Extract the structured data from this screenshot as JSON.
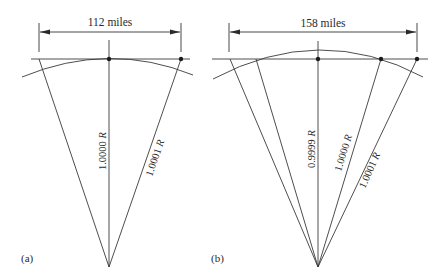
{
  "panels": [
    {
      "id": "a",
      "caption": "(a)",
      "dimension_label": "112 miles",
      "radii": [
        {
          "value": "1.0000",
          "unit": "R"
        },
        {
          "value": "1.0001",
          "unit": "R"
        }
      ]
    },
    {
      "id": "b",
      "caption": "(b)",
      "dimension_label": "158 miles",
      "radii": [
        {
          "value": "0.9999",
          "unit": "R"
        },
        {
          "value": "1.0000",
          "unit": "R"
        },
        {
          "value": "1.0001",
          "unit": "R"
        }
      ]
    }
  ],
  "colors": {
    "line": "#3a3a3a",
    "background": "#ffffff"
  }
}
